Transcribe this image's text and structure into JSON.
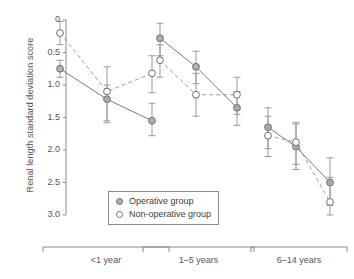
{
  "chart_data": {
    "type": "line",
    "title": "",
    "xlabel": "",
    "ylabel": "Renal length standard deviation score",
    "ylim": [
      3.0,
      0
    ],
    "y_inverted": true,
    "grid": false,
    "yticks": [
      "0",
      "0.5",
      "1.0",
      "1.5",
      "2.0",
      "2.5",
      "3.0"
    ],
    "ytick_values": [
      0,
      0.5,
      1.0,
      1.5,
      2.0,
      2.5,
      3.0
    ],
    "group_labels": [
      "<1 year",
      "1–5 years",
      "6–14 years"
    ],
    "legend_position": "lower-center",
    "series": [
      {
        "name": "Operative group",
        "marker": "filled-circle",
        "line_style": "solid",
        "values": [
          0.75,
          1.22,
          1.55,
          0.28,
          0.72,
          1.35,
          1.65,
          1.95,
          2.5
        ],
        "err_low": [
          0.62,
          1.0,
          1.28,
          0.05,
          0.48,
          1.1,
          1.35,
          1.6,
          2.12
        ],
        "err_high": [
          0.88,
          1.55,
          1.78,
          0.55,
          0.98,
          1.62,
          1.98,
          2.3,
          2.85
        ]
      },
      {
        "name": "Non-operative group",
        "marker": "open-circle",
        "line_style": "dashed",
        "values": [
          0.2,
          1.1,
          0.82,
          0.62,
          1.15,
          1.15,
          1.78,
          1.88,
          2.8
        ],
        "err_low": [
          0.02,
          0.72,
          0.55,
          0.38,
          0.82,
          0.88,
          1.48,
          1.58,
          2.42
        ],
        "err_high": [
          0.38,
          1.58,
          1.12,
          0.88,
          1.48,
          1.45,
          2.1,
          2.22,
          3.0
        ]
      }
    ],
    "x_positions": [
      60,
      107,
      152,
      160,
      196,
      237,
      268,
      296,
      330
    ],
    "group_spans": [
      [
        0,
        2
      ],
      [
        3,
        5
      ],
      [
        6,
        8
      ]
    ]
  },
  "legend": {
    "items": [
      {
        "label": "Operative group",
        "marker": "filled-circle"
      },
      {
        "label": "Non-operative group",
        "marker": "open-circle"
      }
    ]
  },
  "colors": {
    "axis": "#8a8a8a",
    "operative_line": "#7a7a7a",
    "nonoperative_line": "#9a9a9a",
    "marker_fill": "#b0b0b0",
    "marker_stroke": "#6e6e6e",
    "text": "#555555"
  }
}
